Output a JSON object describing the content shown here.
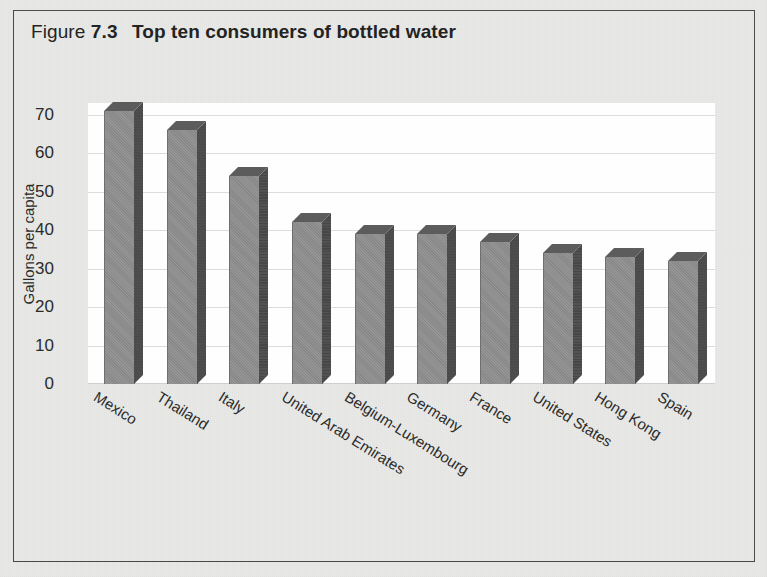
{
  "figure": {
    "label": "Figure",
    "number": "7.3",
    "title": "Top ten consumers of bottled water"
  },
  "colors": {
    "page_background": "#e9e9e7",
    "frame_border": "#4a4a4a",
    "plot_background": "#fefefe",
    "bar_front": "#8f8f8f",
    "bar_side": "#4b4b4b",
    "bar_top": "#5c5c5c",
    "gridline": "#dcdcdc",
    "text": "#2b2b2b"
  },
  "chart_data": {
    "type": "bar",
    "title": "Top ten consumers of bottled water",
    "xlabel": "",
    "ylabel": "Gallons per capita",
    "categories": [
      "Mexico",
      "Thailand",
      "Italy",
      "United Arab Emirates",
      "Belgium-Luxembourg",
      "Germany",
      "France",
      "United States",
      "Hong Kong",
      "Spain"
    ],
    "values": [
      71,
      66,
      54,
      42,
      39,
      39,
      37,
      34,
      33,
      32
    ],
    "ylim": [
      0,
      73
    ],
    "yticks": [
      0,
      10,
      20,
      30,
      40,
      50,
      60,
      70
    ],
    "ytick_labels": [
      "0",
      "10",
      "20",
      "30",
      "40",
      "50",
      "60",
      "70"
    ],
    "grid": true,
    "legend": false,
    "style": "3d-columns"
  }
}
